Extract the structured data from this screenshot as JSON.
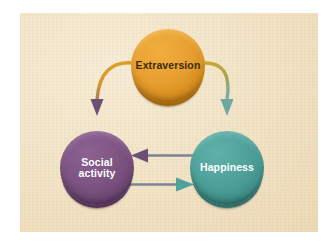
{
  "figure": {
    "panel_background": "#f2e3c6",
    "canvas_background": "#ffffff"
  },
  "nodes": [
    {
      "id": "extraversion",
      "label": "Extraversion",
      "label_lines": [
        "Extraversion"
      ],
      "color": "#e8a130",
      "text_color": "#3c2a12",
      "shape": "circle",
      "position": {
        "x": 168,
        "y": 66
      }
    },
    {
      "id": "social-activity",
      "label": "Social activity",
      "label_lines": [
        "Social",
        "activity"
      ],
      "color": "#7e5583",
      "text_color": "#ffffff",
      "shape": "circle",
      "position": {
        "x": 97,
        "y": 168
      }
    },
    {
      "id": "happiness",
      "label": "Happiness",
      "label_lines": [
        "Happiness"
      ],
      "color": "#4fa29b",
      "text_color": "#ffffff",
      "shape": "circle",
      "position": {
        "x": 227,
        "y": 168
      }
    }
  ],
  "arrows": [
    {
      "id": "extraversion-to-social",
      "from": "extraversion",
      "to": "social-activity",
      "style": "curved",
      "shaft_color": "#d99a28",
      "head_color": "#7e5583"
    },
    {
      "id": "extraversion-to-happiness",
      "from": "extraversion",
      "to": "happiness",
      "style": "curved",
      "shaft_color": "#a9a44a",
      "head_color": "#6fa8a2"
    },
    {
      "id": "happiness-to-social",
      "from": "happiness",
      "to": "social-activity",
      "style": "straight",
      "shaft_color": "#7b8596",
      "head_color": "#6d4f72"
    },
    {
      "id": "social-to-happiness",
      "from": "social-activity",
      "to": "happiness",
      "style": "straight",
      "shaft_color": "#7b8596",
      "head_color": "#4fa29b"
    }
  ]
}
